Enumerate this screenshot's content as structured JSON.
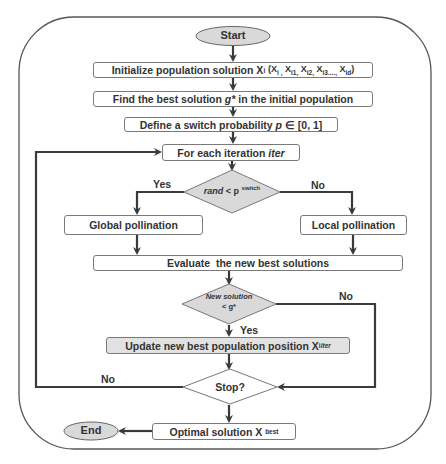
{
  "diagram": {
    "type": "flowchart",
    "colors": {
      "line": "#3a3a3a",
      "shape_fill": "#d9d9d9",
      "box_fill": "#ffffff",
      "highlight_box_fill": "#e2e2e2",
      "text": "#333333"
    },
    "nodes": {
      "start": "Start",
      "initialize": "Initialize population solution X",
      "initialize_sub": "i",
      "initialize_args": "(X",
      "initialize_args_full": "(Xi1, Xi2, Xi3,..., Xid)",
      "find_best": "Find the best solution g* in the initial population",
      "find_best_pre": "Find the best solution ",
      "find_best_var": "g*",
      "find_best_post": " in the initial population",
      "define_switch_pre": "Define a switch probability ",
      "define_switch_var": "p",
      "define_switch_post": " ∈ [0, 1]",
      "for_each_pre": "For each iteration ",
      "for_each_var": "iter",
      "decision1_var": "rand",
      "decision1_op": " < p ",
      "decision1_sup": "switch",
      "global": "Global pollination",
      "local": "Local pollination",
      "evaluate": "Evaluate  the new best solutions",
      "decision2_line1": "New solution",
      "decision2_line2": "< g*",
      "update_pre": "Update new best population position X",
      "update_sub": "i",
      "update_sup": "iter",
      "stop": "Stop?",
      "optimal_pre": "Optimal solution X ",
      "optimal_sup": "best",
      "end": "End"
    },
    "edge_labels": {
      "yes1": "Yes",
      "no1": "No",
      "no2": "No",
      "yes2": "Yes",
      "no3": "No"
    }
  }
}
